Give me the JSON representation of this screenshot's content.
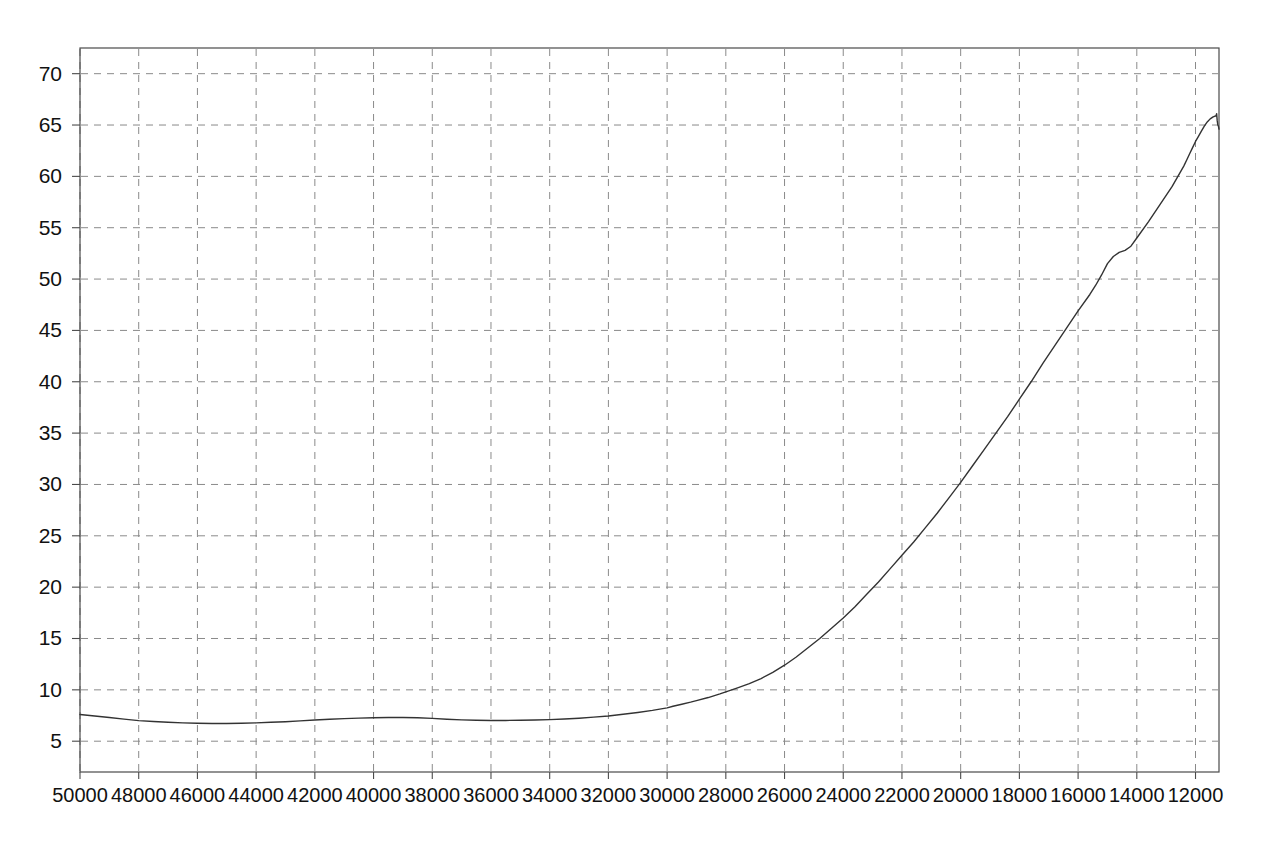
{
  "chart_data": {
    "type": "line",
    "title": "",
    "subtitle": "",
    "xlabel": "",
    "ylabel": "",
    "xlim": [
      50000,
      11200
    ],
    "ylim": [
      2.0,
      72.5
    ],
    "x_reversed": true,
    "grid": true,
    "legend": null,
    "legend_position": "none",
    "x_ticks": [
      50000,
      48000,
      46000,
      44000,
      42000,
      40000,
      38000,
      36000,
      34000,
      32000,
      30000,
      28000,
      26000,
      24000,
      22000,
      20000,
      18000,
      16000,
      14000,
      12000
    ],
    "x_tick_labels": [
      "50000",
      "48000",
      "46000",
      "44000",
      "42000",
      "40000",
      "38000",
      "36000",
      "34000",
      "32000",
      "30000",
      "28000",
      "26000",
      "24000",
      "22000",
      "20000",
      "18000",
      "16000",
      "14000",
      "12000"
    ],
    "y_ticks": [
      5,
      10,
      15,
      20,
      25,
      30,
      35,
      40,
      45,
      50,
      55,
      60,
      65,
      70
    ],
    "y_tick_labels": [
      "5",
      "10",
      "15",
      "20",
      "25",
      "30",
      "35",
      "40",
      "45",
      "50",
      "55",
      "60",
      "65",
      "70"
    ],
    "series": [
      {
        "name": "curve",
        "color": "#333333",
        "line_width": 1.4,
        "x": [
          50000,
          49500,
          49000,
          48500,
          48000,
          47500,
          47000,
          46500,
          46000,
          45500,
          45000,
          44500,
          44000,
          43500,
          43000,
          42500,
          42000,
          41500,
          41000,
          40500,
          40000,
          39500,
          39000,
          38500,
          38000,
          37500,
          37000,
          36500,
          36000,
          35500,
          35000,
          34500,
          34000,
          33500,
          33000,
          32500,
          32000,
          31500,
          31000,
          30500,
          30000,
          29800,
          29500,
          29200,
          29000,
          28600,
          28200,
          28000,
          27600,
          27200,
          26800,
          26400,
          26000,
          25600,
          25200,
          24800,
          24400,
          24000,
          23600,
          23200,
          22800,
          22400,
          22000,
          21600,
          21200,
          20800,
          20400,
          20000,
          19600,
          19200,
          18800,
          18400,
          18000,
          17600,
          17200,
          16800,
          16400,
          16000,
          15600,
          15400,
          15200,
          15000,
          14800,
          14600,
          14400,
          14200,
          14000,
          13600,
          13200,
          12800,
          12600,
          12400,
          12300,
          12200,
          12100,
          12000,
          11900,
          11800,
          11700,
          11600,
          11500,
          11400,
          11300
        ],
        "y": [
          7.6,
          7.45,
          7.3,
          7.15,
          7.0,
          6.92,
          6.85,
          6.78,
          6.74,
          6.72,
          6.72,
          6.74,
          6.78,
          6.84,
          6.9,
          6.98,
          7.06,
          7.14,
          7.2,
          7.25,
          7.28,
          7.3,
          7.3,
          7.28,
          7.22,
          7.14,
          7.08,
          7.04,
          7.02,
          7.02,
          7.04,
          7.06,
          7.1,
          7.16,
          7.24,
          7.34,
          7.46,
          7.62,
          7.8,
          8.0,
          8.25,
          8.4,
          8.6,
          8.8,
          8.95,
          9.25,
          9.6,
          9.8,
          10.2,
          10.6,
          11.1,
          11.7,
          12.4,
          13.2,
          14.1,
          15.0,
          16.0,
          17.0,
          18.1,
          19.3,
          20.5,
          21.8,
          23.1,
          24.4,
          25.8,
          27.2,
          28.7,
          30.2,
          31.8,
          33.4,
          35.0,
          36.6,
          38.3,
          40.0,
          41.8,
          43.5,
          45.2,
          46.9,
          48.5,
          49.4,
          50.4,
          51.5,
          52.2,
          52.6,
          52.8,
          53.2,
          54.0,
          55.6,
          57.3,
          59.0,
          60.0,
          61.0,
          61.6,
          62.2,
          62.8,
          63.4,
          63.9,
          64.4,
          64.9,
          65.3,
          65.6,
          65.8,
          65.9
        ]
      }
    ],
    "annotations": [
      {
        "name": "peak",
        "x": 11500,
        "y": 66.0,
        "note": "peak near right edge followed by a small dip"
      }
    ],
    "peak_detail": {
      "x": [
        11300,
        11280,
        11260,
        11240,
        11220,
        11200
      ],
      "y": [
        65.9,
        66.1,
        65.4,
        65.0,
        64.9,
        64.6
      ]
    }
  },
  "plot_frame": {
    "left": 80,
    "top": 48,
    "right": 1219,
    "bottom": 772,
    "frame_color": "#4a4a4a",
    "grid_color": "#8a8a8a",
    "background": "#ffffff"
  }
}
